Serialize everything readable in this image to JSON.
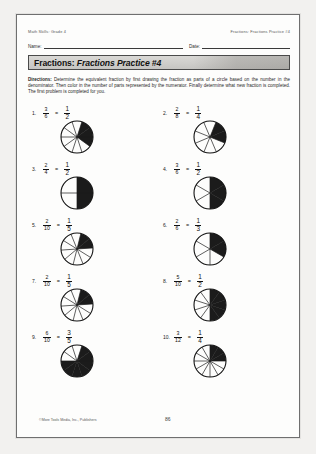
{
  "header": {
    "left": "Math Skills: Grade 4",
    "right": "Fractions: Fractions Practice #4"
  },
  "fields": {
    "name_label": "Name:",
    "date_label": "Date:"
  },
  "title": {
    "prefix": "Fractions:",
    "emphasis": "Fractions Practice #4"
  },
  "directions": {
    "label": "Directions:",
    "text": " Determine the equivalent fraction by first drawing the fraction as parts of a circle based on the number in the denominator. Then color in the number of parts represented by the numerator. Finally determine what new fraction is completed. The first problem is completed for you."
  },
  "equals_sign": "=",
  "problems": [
    {
      "number": "1.",
      "numerator": "3",
      "denominator": "6",
      "answer_numerator": "1",
      "answer_denominator": "2",
      "slices": 10,
      "shaded": 3,
      "rotation": 18
    },
    {
      "number": "2.",
      "numerator": "2",
      "denominator": "8",
      "answer_numerator": "1",
      "answer_denominator": "4",
      "slices": 8,
      "shaded": 2,
      "rotation": 22
    },
    {
      "number": "3.",
      "numerator": "2",
      "denominator": "4",
      "answer_numerator": "1",
      "answer_denominator": "2",
      "slices": 4,
      "shaded": 2,
      "rotation": 0
    },
    {
      "number": "4.",
      "numerator": "3",
      "denominator": "6",
      "answer_numerator": "1",
      "answer_denominator": "2",
      "slices": 6,
      "shaded": 3,
      "rotation": 0
    },
    {
      "number": "5.",
      "numerator": "2",
      "denominator": "10",
      "answer_numerator": "1",
      "answer_denominator": "5",
      "slices": 10,
      "shaded": 2,
      "rotation": 14
    },
    {
      "number": "6.",
      "numerator": "2",
      "denominator": "6",
      "answer_numerator": "1",
      "answer_denominator": "3",
      "slices": 6,
      "shaded": 2,
      "rotation": 0
    },
    {
      "number": "7.",
      "numerator": "2",
      "denominator": "10",
      "answer_numerator": "1",
      "answer_denominator": "5",
      "slices": 10,
      "shaded": 2,
      "rotation": 14
    },
    {
      "number": "8.",
      "numerator": "5",
      "denominator": "10",
      "answer_numerator": "1",
      "answer_denominator": "2",
      "slices": 10,
      "shaded": 5,
      "rotation": 0
    },
    {
      "number": "9.",
      "numerator": "6",
      "denominator": "10",
      "answer_numerator": "3",
      "answer_denominator": "5",
      "slices": 10,
      "shaded": 7,
      "rotation": 18
    },
    {
      "number": "10.",
      "numerator": "3",
      "denominator": "12",
      "answer_numerator": "1",
      "answer_denominator": "4",
      "slices": 12,
      "shaded": 3,
      "rotation": 0
    }
  ],
  "footer": {
    "copyright": "©More Tools Media, Inc., Publishers",
    "page_number": "86"
  },
  "colors": {
    "shade": "#1b1b1b",
    "ink": "#111111",
    "title_bar": "#d3d2cf"
  }
}
